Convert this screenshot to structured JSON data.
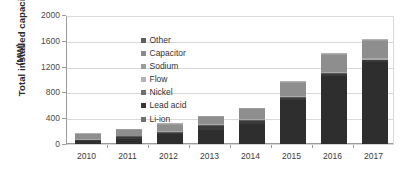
{
  "chart_data": {
    "type": "bar",
    "subtype": "stacked-vertical",
    "title": "",
    "xlabel": "",
    "ylabel": "Total installed capacity",
    "ylabel_line1": "Total installed capacity",
    "ylabel_line2": "(MW)",
    "yunit": "MW",
    "ylim": [
      0,
      2000
    ],
    "yticks": [
      0,
      400,
      800,
      1200,
      1600,
      2000
    ],
    "ytick_labels": [
      "0",
      "400",
      "800",
      "1200",
      "1600",
      "2000"
    ],
    "grid": true,
    "grid_axis": "y",
    "legend_position": "upper-left-inside",
    "legend_reversed": true,
    "categories": [
      "2010",
      "2011",
      "2012",
      "2013",
      "2014",
      "2015",
      "2016",
      "2017"
    ],
    "series": [
      {
        "name": "Li-ion",
        "color": "#2e2e2e",
        "values": [
          40,
          85,
          150,
          225,
          310,
          690,
          1060,
          1270
        ]
      },
      {
        "name": "Lead acid",
        "color": "#3a3a3a",
        "values": [
          18,
          25,
          28,
          55,
          48,
          30,
          28,
          28
        ]
      },
      {
        "name": "Nickel",
        "color": "#5a5a5a",
        "values": [
          12,
          10,
          10,
          10,
          10,
          10,
          10,
          10
        ]
      },
      {
        "name": "Flow",
        "color": "#a8a8a8",
        "values": [
          12,
          12,
          14,
          16,
          18,
          20,
          22,
          22
        ]
      },
      {
        "name": "Sodium",
        "color": "#8e8e8e",
        "values": [
          70,
          88,
          98,
          110,
          152,
          195,
          260,
          270
        ]
      },
      {
        "name": "Capacitor",
        "color": "#9d9d9d",
        "values": [
          10,
          12,
          12,
          12,
          14,
          16,
          16,
          16
        ]
      },
      {
        "name": "Other",
        "color": "#b0b0b0",
        "values": [
          8,
          8,
          8,
          7,
          8,
          14,
          14,
          14
        ]
      }
    ],
    "totals": [
      170,
      240,
      320,
      435,
      560,
      975,
      1410,
      1630
    ],
    "legend_entries": [
      {
        "label": "Other",
        "color": "#5f5f5f"
      },
      {
        "label": "Capacitor",
        "color": "#8a8a8a"
      },
      {
        "label": "Sodium",
        "color": "#9c9c9c"
      },
      {
        "label": "Flow",
        "color": "#b4b4b4"
      },
      {
        "label": "Nickel",
        "color": "#6e6e6e"
      },
      {
        "label": "Lead acid",
        "color": "#363636"
      },
      {
        "label": "Li-ion",
        "color": "#707070"
      }
    ]
  }
}
